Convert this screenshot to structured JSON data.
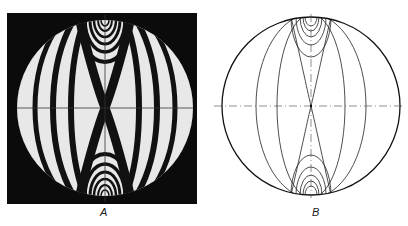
{
  "figure": {
    "panels": [
      {
        "id": "A",
        "label": "A",
        "description": "Photograph of isochromatic fringe pattern in disc under diametral compression"
      },
      {
        "id": "B",
        "label": "B",
        "description": "Line drawing of isochromatic fringe pattern in disc under diametral compression"
      }
    ]
  }
}
